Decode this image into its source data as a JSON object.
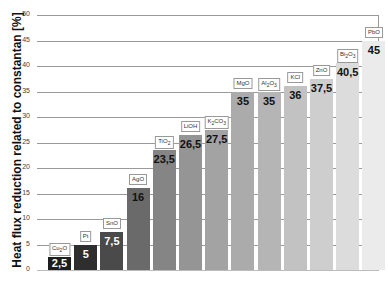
{
  "chart_data": {
    "type": "bar",
    "title": "",
    "xlabel": "",
    "ylabel": "Heat flux reduction related to constantan  [%]",
    "ylim": [
      0,
      50
    ],
    "yticks": [
      0,
      5,
      10,
      15,
      20,
      25,
      30,
      35,
      40,
      45,
      50
    ],
    "grid": true,
    "categories": [
      "Cu2O",
      "Pt",
      "SnO",
      "AgO",
      "TiO2",
      "LiOH",
      "K2CO3",
      "MgO",
      "Al2O3",
      "KCl",
      "ZnO",
      "Bi2O3",
      "PbO"
    ],
    "category_labels_html": [
      "Cu<sub>2</sub>O",
      "Pt",
      "SnO",
      "AgO",
      "TiO<sub>2</sub>",
      "LiOH",
      "K<sub>2</sub>CO<sub>3</sub>",
      "MgO",
      "Al<sub>2</sub>O<sub>3</sub>",
      "KCl",
      "ZnO",
      "Bi<sub>2</sub>O<sub>3</sub>",
      "PbO"
    ],
    "values": [
      2.5,
      5,
      7.5,
      16,
      23.5,
      26.5,
      27.5,
      35,
      35,
      36,
      37.5,
      40.5,
      45
    ],
    "value_labels": [
      "2,5",
      "5",
      "7,5",
      "16",
      "23,5",
      "26,5",
      "27,5",
      "35",
      "35",
      "36",
      "37,5",
      "40,5",
      "45"
    ],
    "colors": [
      "#1e1e1e",
      "#2e2e2e",
      "#4a4a4a",
      "#6a6a6a",
      "#858585",
      "#959595",
      "#a3a3a3",
      "#ababab",
      "#b5b5b5",
      "#c2c2c2",
      "#cecece",
      "#dcdcdc",
      "#ebebeb"
    ],
    "value_text_colors": [
      "#ffffff",
      "#ffffff",
      "#ffffff",
      "#111111",
      "#111111",
      "#111111",
      "#111111",
      "#111111",
      "#111111",
      "#111111",
      "#111111",
      "#111111",
      "#111111"
    ],
    "legend": null
  }
}
